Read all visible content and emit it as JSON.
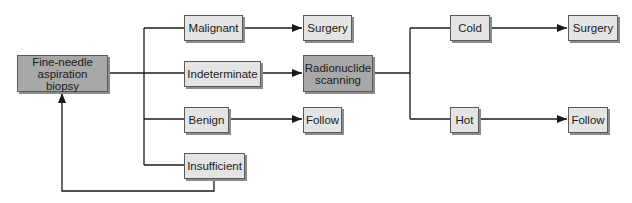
{
  "diagram": {
    "type": "flowchart",
    "colors": {
      "dark_fill": "#a8a8a8",
      "light_fill": "#e4e4e4",
      "border": "#5a5a5a",
      "line": "#1a1a1a"
    },
    "nodes": {
      "fna": "Fine-needle\naspiration biopsy",
      "malignant": "Malignant",
      "indeterminate": "Indeterminate",
      "benign": "Benign",
      "insufficient": "Insufficient",
      "surgery1": "Surgery",
      "radionuclide": "Radionuclide\nscanning",
      "follow1": "Follow",
      "cold": "Cold",
      "hot": "Hot",
      "surgery2": "Surgery",
      "follow2": "Follow"
    },
    "edges": [
      {
        "from": "fna",
        "to": "malignant"
      },
      {
        "from": "fna",
        "to": "indeterminate"
      },
      {
        "from": "fna",
        "to": "benign"
      },
      {
        "from": "fna",
        "to": "insufficient"
      },
      {
        "from": "malignant",
        "to": "surgery1"
      },
      {
        "from": "indeterminate",
        "to": "radionuclide"
      },
      {
        "from": "benign",
        "to": "follow1"
      },
      {
        "from": "insufficient",
        "to": "fna"
      },
      {
        "from": "radionuclide",
        "to": "cold"
      },
      {
        "from": "radionuclide",
        "to": "hot"
      },
      {
        "from": "cold",
        "to": "surgery2"
      },
      {
        "from": "hot",
        "to": "follow2"
      }
    ]
  }
}
